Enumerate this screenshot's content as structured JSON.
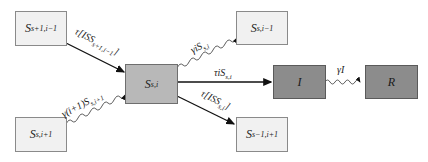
{
  "diagram": {
    "type": "compartment-flow",
    "nodes": {
      "s_plus1_i_minus1": {
        "base": "S",
        "sub": "s+1,i−1"
      },
      "s_i": {
        "base": "S",
        "sub": "s,i"
      },
      "s_i_minus1": {
        "base": "S",
        "sub": "s,i−1"
      },
      "s_i_plus1": {
        "base": "S",
        "sub": "s,i+1"
      },
      "s_minus1_i_plus1": {
        "base": "S",
        "sub": "s−1,i+1"
      },
      "infected": {
        "base": "I",
        "sub": ""
      },
      "recovered": {
        "base": "R",
        "sub": ""
      }
    },
    "edges": {
      "in_from_s_plus1": {
        "pre": "τ[ISS",
        "sub": "s+1,i−1",
        "post": "]"
      },
      "in_from_i_plus1": {
        "pre": "γ(i+1)S",
        "sub": "s,i+1",
        "post": ""
      },
      "to_s_i_minus1": {
        "pre": "γiS",
        "sub": "s,i",
        "post": ""
      },
      "to_infected": {
        "pre": "τiS",
        "sub": "s,i",
        "post": ""
      },
      "to_s_minus1": {
        "pre": "τ[ISS",
        "sub": "s,i",
        "post": "]"
      },
      "infected_to_recovered": {
        "pre": "γI",
        "sub": "",
        "post": ""
      }
    },
    "colors": {
      "light_box": "#f1f1f1",
      "mid_box": "#b8b8b8",
      "dark_box": "#8c8c8c",
      "arrow": "#111111"
    }
  }
}
